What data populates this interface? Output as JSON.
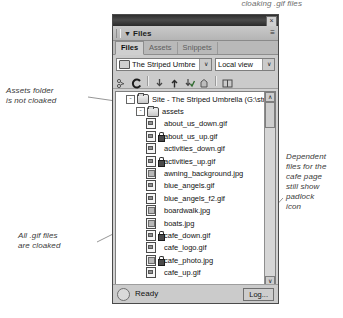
{
  "annotations": {
    "top": "cloaking .gif files",
    "assets": "Assets folder\nis not cloaked",
    "assets_line1": "Assets folder",
    "assets_line2": "is not cloaked",
    "gif_line1": "All .gif files",
    "gif_line2": "are cloaked",
    "dependent": "Dependent files for the cafe page still show padlock icon",
    "dep_line1": "Dependent",
    "dep_line2": "files for the",
    "dep_line3": "cafe page",
    "dep_line4": "still show",
    "dep_line5": "padlock",
    "dep_line6": "icon"
  },
  "panel": {
    "title": "Files",
    "close_label": "×",
    "options_menu_label": "≡",
    "collapse_arrow": "▼",
    "tabs": [
      {
        "label": "Files",
        "active": true
      },
      {
        "label": "Assets",
        "active": false
      },
      {
        "label": "Snippets",
        "active": false
      }
    ],
    "site_combo": {
      "value": "The Striped Umbre",
      "arrow": "∨"
    },
    "view_combo": {
      "value": "Local view",
      "arrow": "∨"
    },
    "toolbar_icons": [
      "connect-icon",
      "refresh-icon",
      "get-files-icon",
      "put-files-icon",
      "check-out-icon",
      "check-in-icon",
      "expand-icon"
    ],
    "refresh_glyph": "C",
    "get_glyph": "⇩",
    "put_glyph": "⇧",
    "scroll": {
      "up_arrow": "∧",
      "down_arrow": "∨",
      "left_arrow": "‹",
      "right_arrow": "›"
    },
    "status": {
      "text": "Ready",
      "log_button": "Log..."
    }
  },
  "file_tree": {
    "root": {
      "label": "Site - The Striped Umbrella (G:\\strip",
      "expander": "-",
      "cloaked": false
    },
    "assets_folder": {
      "label": "assets",
      "expander": "-",
      "cloaked": false
    },
    "files": [
      {
        "name": "about_us_down.gif",
        "type": "gif",
        "cloaked": false
      },
      {
        "name": "about_us_up.gif",
        "type": "gif",
        "cloaked": true
      },
      {
        "name": "activities_down.gif",
        "type": "gif",
        "cloaked": false
      },
      {
        "name": "activities_up.gif",
        "type": "gif",
        "cloaked": true
      },
      {
        "name": "awning_background.jpg",
        "type": "jpg",
        "cloaked": false
      },
      {
        "name": "blue_angels.gif",
        "type": "gif",
        "cloaked": false
      },
      {
        "name": "blue_angels_f2.gif",
        "type": "gif",
        "cloaked": false
      },
      {
        "name": "boardwalk.jpg",
        "type": "jpg",
        "cloaked": false
      },
      {
        "name": "boats.jpg",
        "type": "jpg",
        "cloaked": false
      },
      {
        "name": "cafe_down.gif",
        "type": "gif",
        "cloaked": true
      },
      {
        "name": "cafe_logo.gif",
        "type": "gif",
        "cloaked": false
      },
      {
        "name": "cafe_photo.jpg",
        "type": "jpg",
        "cloaked": true
      },
      {
        "name": "cafe_up.gif",
        "type": "gif",
        "cloaked": false
      }
    ]
  }
}
